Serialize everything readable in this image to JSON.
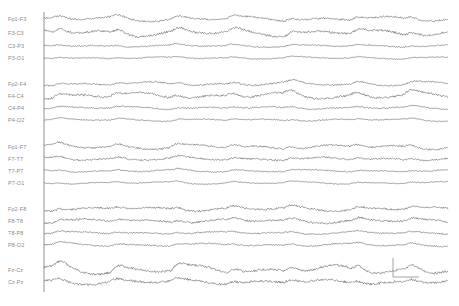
{
  "chart_data": {
    "type": "line",
    "title": "",
    "xlabel": "",
    "ylabel": "",
    "grid": false,
    "legend": "none",
    "trace_color": "#555555",
    "axis_color": "#777777",
    "label_color": "#8a8a8a",
    "x_range_px": [
      44,
      448
    ],
    "periodic_complex_x_px": [
      58,
      116,
      176,
      232,
      290,
      356,
      410
    ],
    "groups": [
      {
        "name": "Left parasagittal",
        "channels": [
          "Fp1-F3",
          "F3-C3",
          "C3-P3",
          "P3-O1"
        ]
      },
      {
        "name": "Right parasagittal",
        "channels": [
          "Fp2-F4",
          "F4-C4",
          "C4-P4",
          "P4-O2"
        ]
      },
      {
        "name": "Left temporal",
        "channels": [
          "Fp1-F7",
          "F7-T7",
          "T7-P7",
          "P7-O1"
        ]
      },
      {
        "name": "Right temporal",
        "channels": [
          "Fp2-F8",
          "F8-T8",
          "T8-P8",
          "P8-O2"
        ]
      },
      {
        "name": "Midline",
        "channels": [
          "Fz-Cz",
          "Cz-Pz"
        ]
      }
    ],
    "series": [
      {
        "name": "Fp1-F3",
        "baseline_y": 19,
        "amplitude": 6,
        "noise": 1.2,
        "seed": 1
      },
      {
        "name": "F3-C3",
        "baseline_y": 33,
        "amplitude": 8,
        "noise": 1.5,
        "seed": 2
      },
      {
        "name": "C3-P3",
        "baseline_y": 46,
        "amplitude": 3,
        "noise": 0.8,
        "seed": 3
      },
      {
        "name": "P3-O1",
        "baseline_y": 58,
        "amplitude": 2.5,
        "noise": 0.6,
        "seed": 4
      },
      {
        "name": "Fp2-F4",
        "baseline_y": 84,
        "amplitude": 5,
        "noise": 1.0,
        "seed": 5
      },
      {
        "name": "F4-C4",
        "baseline_y": 96,
        "amplitude": 8,
        "noise": 1.4,
        "seed": 6
      },
      {
        "name": "C4-P4",
        "baseline_y": 108,
        "amplitude": 3,
        "noise": 0.9,
        "seed": 7
      },
      {
        "name": "P4-O2",
        "baseline_y": 120,
        "amplitude": 3,
        "noise": 0.7,
        "seed": 8
      },
      {
        "name": "Fp1-F7",
        "baseline_y": 147,
        "amplitude": 6,
        "noise": 1.2,
        "seed": 9
      },
      {
        "name": "F7-T7",
        "baseline_y": 159,
        "amplitude": 4,
        "noise": 1.2,
        "seed": 10
      },
      {
        "name": "T7-P7",
        "baseline_y": 171,
        "amplitude": 3,
        "noise": 0.8,
        "seed": 11
      },
      {
        "name": "P7-O1",
        "baseline_y": 183,
        "amplitude": 3,
        "noise": 0.6,
        "seed": 12
      },
      {
        "name": "Fp2-F8",
        "baseline_y": 209,
        "amplitude": 5,
        "noise": 1.3,
        "seed": 13
      },
      {
        "name": "F8-T8",
        "baseline_y": 221,
        "amplitude": 5,
        "noise": 1.3,
        "seed": 14
      },
      {
        "name": "T8-P8",
        "baseline_y": 233,
        "amplitude": 3,
        "noise": 0.9,
        "seed": 15
      },
      {
        "name": "P8-O2",
        "baseline_y": 245,
        "amplitude": 4,
        "noise": 0.9,
        "seed": 16
      },
      {
        "name": "Fz-Cz",
        "baseline_y": 270,
        "amplitude": 11,
        "noise": 1.6,
        "seed": 17
      },
      {
        "name": "Cz-Pz",
        "baseline_y": 282,
        "amplitude": 6,
        "noise": 1.6,
        "seed": 18
      }
    ],
    "calibration_marker": {
      "x": 393,
      "y_top": 258,
      "y_bottom": 277,
      "width": 26
    }
  },
  "labels": {
    "ch0": "Fp1-F3",
    "ch1": "F3-C3",
    "ch2": "C3-P3",
    "ch3": "P3-O1",
    "ch4": "Fp2-F4",
    "ch5": "F4-C4",
    "ch6": "C4-P4",
    "ch7": "P4-O2",
    "ch8": "Fp1-F7",
    "ch9": "F7-T7",
    "ch10": "T7-P7",
    "ch11": "P7-O1",
    "ch12": "Fp2-F8",
    "ch13": "F8-T8",
    "ch14": "T8-P8",
    "ch15": "P8-O2",
    "ch16": "Fz-Cz",
    "ch17": "Cz-Pz"
  }
}
